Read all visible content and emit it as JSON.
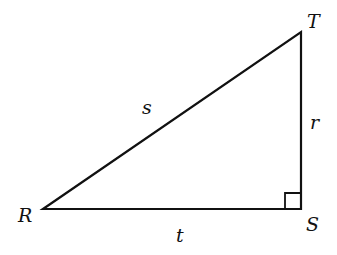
{
  "diagram": {
    "type": "right-triangle",
    "colors": {
      "stroke": "#111111",
      "background": "#ffffff"
    },
    "vertices": [
      {
        "id": "R",
        "label": "R",
        "x": 43,
        "y": 209
      },
      {
        "id": "S",
        "label": "S",
        "x": 301,
        "y": 209
      },
      {
        "id": "T",
        "label": "T",
        "x": 301,
        "y": 32
      }
    ],
    "sides": [
      {
        "id": "s",
        "label": "s",
        "from": "R",
        "to": "T"
      },
      {
        "id": "r",
        "label": "r",
        "from": "T",
        "to": "S"
      },
      {
        "id": "t",
        "label": "t",
        "from": "R",
        "to": "S"
      }
    ],
    "right_angle_at": "S"
  }
}
